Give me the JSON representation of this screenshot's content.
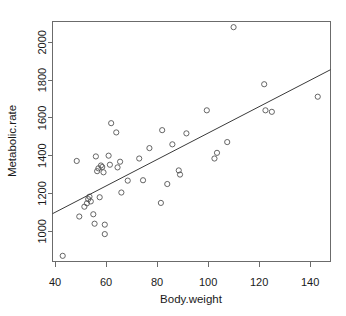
{
  "chart_data": {
    "type": "scatter",
    "title": "",
    "xlabel": "Body.weight",
    "ylabel": "Metabolic.rate",
    "xlim": [
      39,
      148
    ],
    "ylim": [
      840,
      2110
    ],
    "grid": false,
    "legend": "none",
    "xticks": [
      40,
      60,
      80,
      100,
      120,
      140
    ],
    "xtick_labels": [
      "40",
      "60",
      "80",
      "100",
      "120",
      "140"
    ],
    "yticks": [
      1000,
      1200,
      1400,
      1600,
      1800,
      2000
    ],
    "ytick_labels": [
      "1000",
      "1200",
      "1400",
      "1600",
      "1800",
      "2000"
    ],
    "point_marker": "open-circle",
    "point_color": "#555555",
    "line_color": "#3a3a3a",
    "fit_line": {
      "label": "regression-line",
      "x": [
        39.0,
        148.0
      ],
      "y": [
        1093,
        1855
      ]
    },
    "points": [
      {
        "x": 43.0,
        "y": 870
      },
      {
        "x": 48.5,
        "y": 1372
      },
      {
        "x": 49.5,
        "y": 1078
      },
      {
        "x": 51.5,
        "y": 1130
      },
      {
        "x": 52.5,
        "y": 1148
      },
      {
        "x": 53.0,
        "y": 1170
      },
      {
        "x": 53.5,
        "y": 1183
      },
      {
        "x": 54.0,
        "y": 1158
      },
      {
        "x": 55.0,
        "y": 1090
      },
      {
        "x": 55.5,
        "y": 1040
      },
      {
        "x": 56.0,
        "y": 1396
      },
      {
        "x": 56.5,
        "y": 1318
      },
      {
        "x": 57.0,
        "y": 1333
      },
      {
        "x": 57.5,
        "y": 1180
      },
      {
        "x": 58.0,
        "y": 1348
      },
      {
        "x": 58.5,
        "y": 1340
      },
      {
        "x": 59.0,
        "y": 1312
      },
      {
        "x": 59.5,
        "y": 1035
      },
      {
        "x": 59.5,
        "y": 985
      },
      {
        "x": 61.0,
        "y": 1400
      },
      {
        "x": 61.5,
        "y": 1352
      },
      {
        "x": 62.0,
        "y": 1572
      },
      {
        "x": 64.0,
        "y": 1523
      },
      {
        "x": 64.5,
        "y": 1338
      },
      {
        "x": 65.5,
        "y": 1368
      },
      {
        "x": 66.0,
        "y": 1205
      },
      {
        "x": 68.5,
        "y": 1268
      },
      {
        "x": 73.0,
        "y": 1385
      },
      {
        "x": 74.5,
        "y": 1270
      },
      {
        "x": 77.0,
        "y": 1440
      },
      {
        "x": 81.5,
        "y": 1150
      },
      {
        "x": 82.0,
        "y": 1535
      },
      {
        "x": 84.0,
        "y": 1250
      },
      {
        "x": 86.0,
        "y": 1460
      },
      {
        "x": 88.5,
        "y": 1322
      },
      {
        "x": 89.0,
        "y": 1300
      },
      {
        "x": 91.5,
        "y": 1518
      },
      {
        "x": 99.5,
        "y": 1640
      },
      {
        "x": 102.5,
        "y": 1385
      },
      {
        "x": 103.5,
        "y": 1415
      },
      {
        "x": 107.5,
        "y": 1472
      },
      {
        "x": 110.0,
        "y": 2080
      },
      {
        "x": 122.0,
        "y": 1778
      },
      {
        "x": 122.5,
        "y": 1640
      },
      {
        "x": 125.0,
        "y": 1632
      },
      {
        "x": 143.0,
        "y": 1712
      }
    ]
  }
}
